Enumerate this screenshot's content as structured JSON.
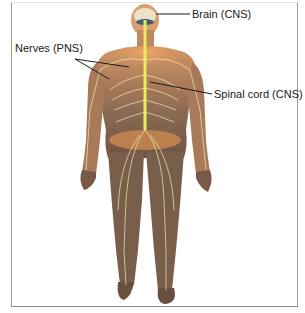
{
  "figure": {
    "labels": {
      "brain": "Brain (CNS)",
      "nerves": "Nerves (PNS)",
      "spinal_cord": "Spinal cord (CNS)"
    },
    "colors": {
      "skin": "#b07a55",
      "skin_dark": "#7a5a45",
      "skin_highlight": "#e8a060",
      "nerve": "#e8f0a0",
      "spinal_cord": "#e8f060",
      "brain": "#e8dcc0",
      "leader_line": "#1a1a1a",
      "frame": "#9a9a9a"
    }
  }
}
